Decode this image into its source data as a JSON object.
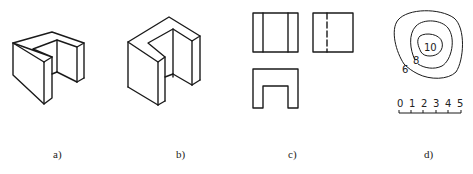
{
  "figures": [
    {
      "id": "a",
      "label": "a)",
      "type": "isometric-view",
      "description": "U-shaped block, isometric projection (variant 1)"
    },
    {
      "id": "b",
      "label": "b)",
      "type": "isometric-view",
      "description": "U-shaped block, isometric projection (variant 2)"
    },
    {
      "id": "c",
      "label": "c)",
      "type": "orthographic-views",
      "description": "Front, side and top views of U-shaped block"
    },
    {
      "id": "d",
      "label": "d)",
      "type": "contour-map",
      "description": "Contour lines with elevation labels and scale bar"
    }
  ],
  "contour": {
    "labels": [
      "10",
      "8",
      "6"
    ]
  },
  "scale_bar": {
    "ticks": [
      "0",
      "1",
      "2",
      "3",
      "4",
      "5"
    ]
  }
}
